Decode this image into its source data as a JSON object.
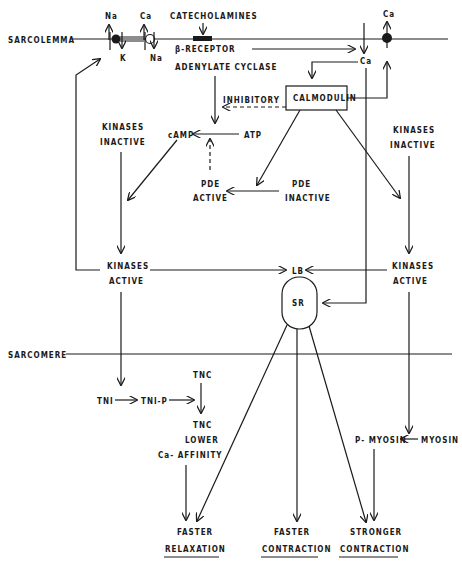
{
  "diagram": {
    "membranes": {
      "sarcolemma": "SARCOLEMMA",
      "sarcomere": "SARCOMERE"
    },
    "ions": {
      "na_out": "Na",
      "k_in": "K",
      "ca_out": "Ca",
      "na_in": "Na",
      "ca_right_out": "Ca",
      "ca_channel_in": "Ca"
    },
    "nodes": {
      "catecholamines": "CATECHOLAMINES",
      "beta_receptor": "β-RECEPTOR",
      "adenylate_cyclase": "ADENYLATE CYCLASE",
      "calmodulin": "CALMODULIN",
      "inhibitory": "INHIBITORY",
      "camp": "cAMP",
      "atp": "ATP",
      "pde_active_1": "PDE",
      "pde_active_2": "ACTIVE",
      "pde_inactive_1": "PDE",
      "pde_inactive_2": "INACTIVE",
      "kinases_inactive_left_1": "KINASES",
      "kinases_inactive_left_2": "INACTIVE",
      "kinases_inactive_right_1": "KINASES",
      "kinases_inactive_right_2": "INACTIVE",
      "kinases_active_left_1": "KINASES",
      "kinases_active_left_2": "ACTIVE",
      "kinases_active_right_1": "KINASES",
      "kinases_active_right_2": "ACTIVE",
      "lb": "LB",
      "sr": "SR",
      "tni": "TNI",
      "tni_p": "TNI-P",
      "tnc_top": "TNC",
      "tnc_lower_1": "TNC",
      "tnc_lower_2": "LOWER",
      "tnc_lower_3": "Ca- AFFINITY",
      "p_myosin": "P- MYOSIN",
      "myosin": "MYOSIN"
    },
    "outcomes": [
      {
        "line1": "FASTER",
        "line2": "RELAXATION"
      },
      {
        "line1": "FASTER",
        "line2": "CONTRACTION"
      },
      {
        "line1": "STRONGER",
        "line2": "CONTRACTION"
      }
    ]
  }
}
